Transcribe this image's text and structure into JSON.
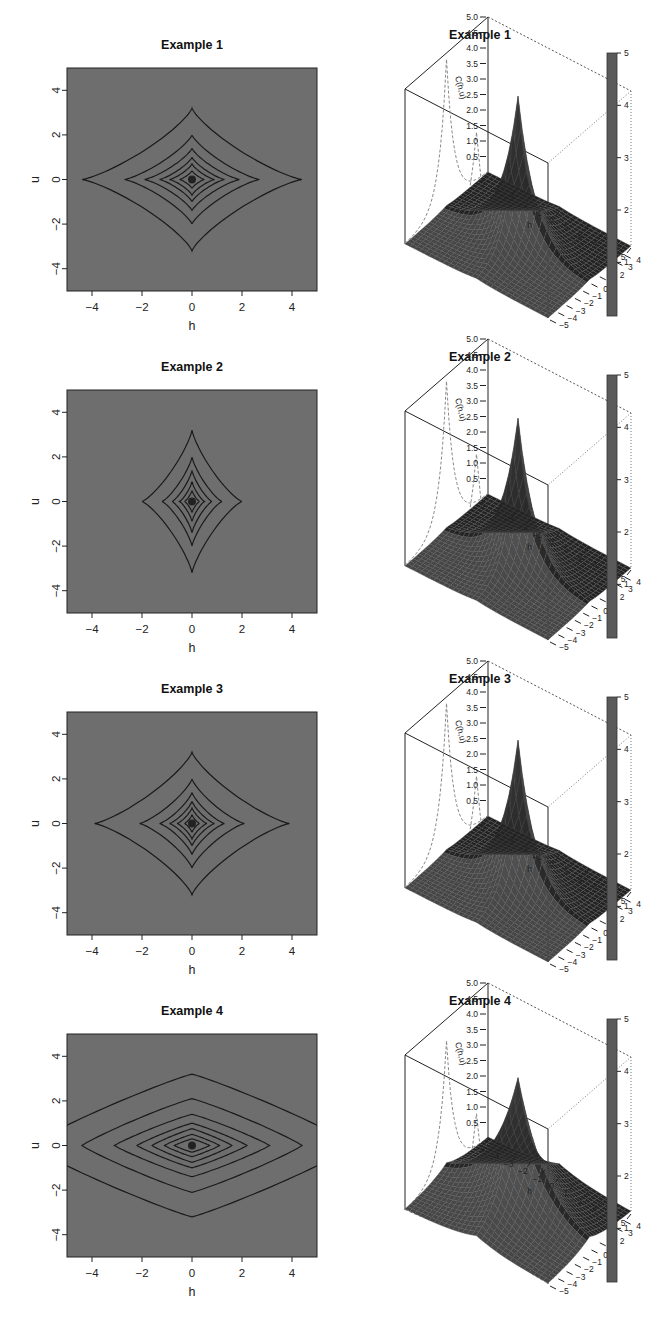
{
  "figure": {
    "panels": [
      {
        "title": "Example 1",
        "kind": "contour"
      },
      {
        "title": "Example 1",
        "kind": "surface"
      },
      {
        "title": "Example 2",
        "kind": "contour"
      },
      {
        "title": "Example 2",
        "kind": "surface"
      },
      {
        "title": "Example 3",
        "kind": "contour"
      },
      {
        "title": "Example 3",
        "kind": "surface"
      },
      {
        "title": "Example 4",
        "kind": "contour"
      },
      {
        "title": "Example 4",
        "kind": "surface"
      }
    ],
    "contour_axes": {
      "xlabel": "h",
      "ylabel": "u",
      "xticks": [
        "−4",
        "−2",
        "0",
        "2",
        "4"
      ],
      "yticks": [
        "4",
        "2",
        "0",
        "−2",
        "−4"
      ]
    },
    "surface_axes": {
      "xlabel": "h",
      "ylabel": "u",
      "zlabel": "C(h,u)",
      "zticks": [
        "5.0",
        "4.5",
        "4.0",
        "3.5",
        "3.0",
        "2.5",
        "2.0",
        "1.5",
        "1.0",
        "0.5"
      ],
      "hticks": [
        "−5",
        "−4",
        "−3",
        "−2",
        "−1",
        "0",
        "1",
        "2",
        "3",
        "4",
        "5"
      ],
      "uticks": [
        "5",
        "4",
        "3",
        "2",
        "1",
        "0",
        "−1",
        "−2",
        "−3",
        "−4",
        "−5"
      ],
      "colorbar_ticks": [
        "5",
        "4",
        "3",
        "2",
        "1"
      ]
    },
    "colors": {
      "contour_bg": "#6e6e6e",
      "contour_line": "#1a1a1a",
      "surface": "#3a3a3a",
      "colorbar": "#5a5a5a"
    }
  },
  "chart_data": [
    {
      "type": "contour",
      "title": "Example 1",
      "xlabel": "h",
      "ylabel": "u",
      "xlim": [
        -5,
        5
      ],
      "ylim": [
        -5,
        5
      ],
      "contours": [
        {
          "h_extent": 4.4,
          "u_extent": 3.2
        },
        {
          "h_extent": 2.7,
          "u_extent": 2.0
        },
        {
          "h_extent": 1.9,
          "u_extent": 1.4
        },
        {
          "h_extent": 1.3,
          "u_extent": 1.0
        },
        {
          "h_extent": 0.9,
          "u_extent": 0.7
        },
        {
          "h_extent": 0.5,
          "u_extent": 0.4
        }
      ],
      "shape": "concave diamond (astroid-like)"
    },
    {
      "type": "surface",
      "title": "Example 1",
      "xlabel": "h",
      "ylabel": "u",
      "zlabel": "C(h,u)",
      "zlim": [
        0,
        5
      ],
      "peak": {
        "h": 0,
        "u": 0,
        "z": 4.8
      },
      "colorbar_range": [
        0,
        5
      ]
    },
    {
      "type": "contour",
      "title": "Example 2",
      "xlabel": "h",
      "ylabel": "u",
      "xlim": [
        -5,
        5
      ],
      "ylim": [
        -5,
        5
      ],
      "contours": [
        {
          "h_extent": 2.0,
          "u_extent": 3.2
        },
        {
          "h_extent": 1.2,
          "u_extent": 2.0
        },
        {
          "h_extent": 0.8,
          "u_extent": 1.4
        },
        {
          "h_extent": 0.5,
          "u_extent": 0.9
        },
        {
          "h_extent": 0.3,
          "u_extent": 0.5
        }
      ],
      "shape": "concave star-diamond, elongated in u"
    },
    {
      "type": "surface",
      "title": "Example 2",
      "xlabel": "h",
      "ylabel": "u",
      "zlabel": "C(h,u)",
      "zlim": [
        0,
        5
      ],
      "peak": {
        "h": 0,
        "u": 0,
        "z": 4.8
      },
      "colorbar_range": [
        0,
        5
      ]
    },
    {
      "type": "contour",
      "title": "Example 3",
      "xlabel": "h",
      "ylabel": "u",
      "xlim": [
        -5,
        5
      ],
      "ylim": [
        -5,
        5
      ],
      "contours": [
        {
          "h_extent": 3.9,
          "u_extent": 3.2
        },
        {
          "h_extent": 2.1,
          "u_extent": 2.0
        },
        {
          "h_extent": 1.3,
          "u_extent": 1.4
        },
        {
          "h_extent": 0.9,
          "u_extent": 1.0
        },
        {
          "h_extent": 0.6,
          "u_extent": 0.7
        },
        {
          "h_extent": 0.3,
          "u_extent": 0.4
        }
      ],
      "shape": "concave diamond"
    },
    {
      "type": "surface",
      "title": "Example 3",
      "xlabel": "h",
      "ylabel": "u",
      "zlabel": "C(h,u)",
      "zlim": [
        0,
        5
      ],
      "peak": {
        "h": 0,
        "u": 0,
        "z": 4.8
      },
      "colorbar_range": [
        0,
        5
      ]
    },
    {
      "type": "contour",
      "title": "Example 4",
      "xlabel": "h",
      "ylabel": "u",
      "xlim": [
        -5,
        5
      ],
      "ylim": [
        -5,
        5
      ],
      "contours": [
        {
          "h_extent": 6.5,
          "u_extent": 3.2
        },
        {
          "h_extent": 4.4,
          "u_extent": 2.1
        },
        {
          "h_extent": 3.1,
          "u_extent": 1.4
        },
        {
          "h_extent": 2.2,
          "u_extent": 1.0
        },
        {
          "h_extent": 1.6,
          "u_extent": 0.75
        },
        {
          "h_extent": 1.1,
          "u_extent": 0.5
        },
        {
          "h_extent": 0.7,
          "u_extent": 0.3
        }
      ],
      "shape": "convex diamond, elongated in h"
    },
    {
      "type": "surface",
      "title": "Example 4",
      "xlabel": "h",
      "ylabel": "u",
      "zlabel": "C(h,u)",
      "zlim": [
        0,
        5
      ],
      "peak": {
        "h": 0,
        "u": 0,
        "z": 4.3
      },
      "colorbar_range": [
        0,
        5
      ]
    }
  ]
}
